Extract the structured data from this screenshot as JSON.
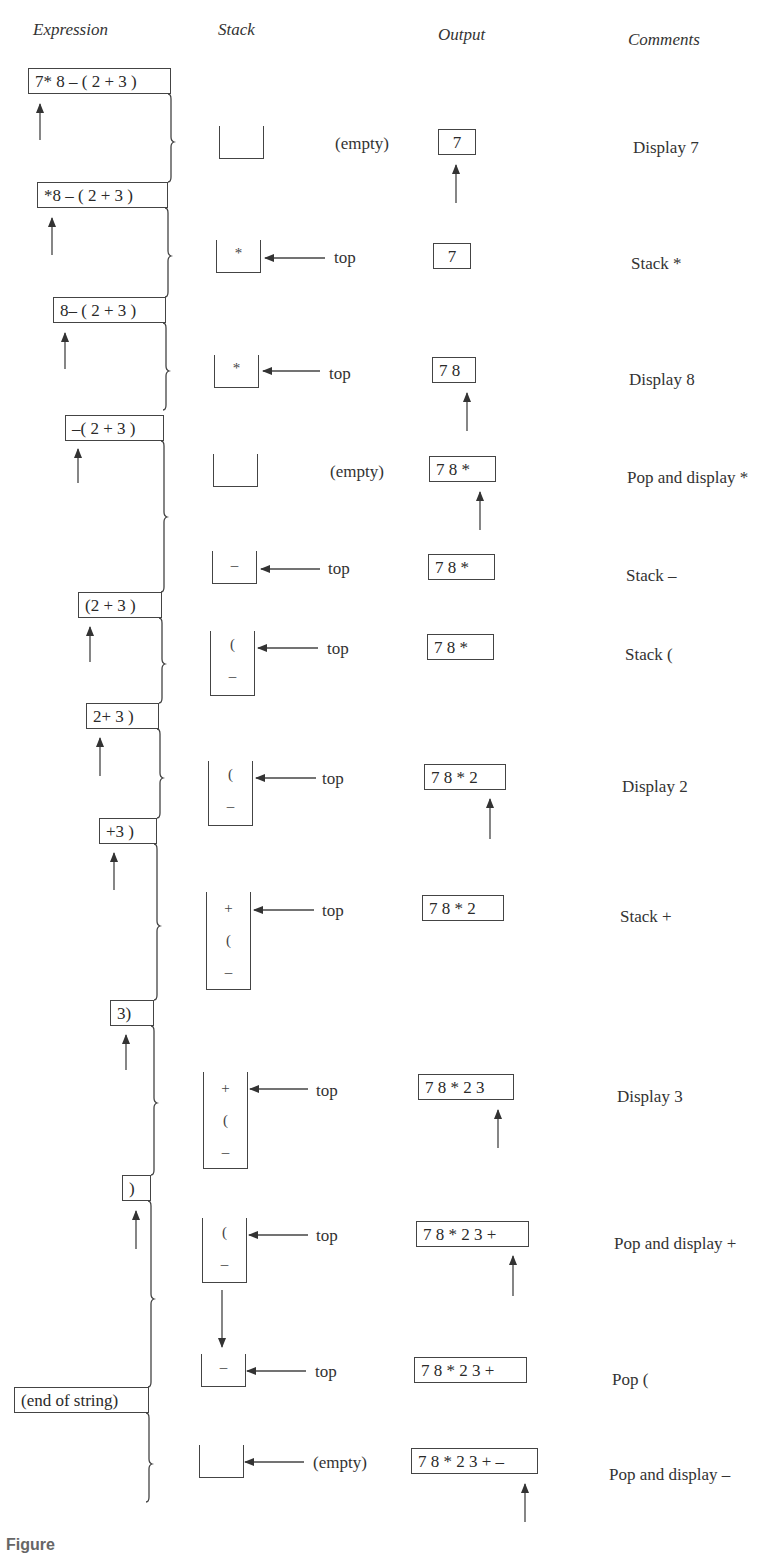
{
  "headers": {
    "expression": "Expression",
    "stack": "Stack",
    "output": "Output",
    "comments": "Comments"
  },
  "expressions": [
    "7* 8 – ( 2 + 3 )",
    "*8 – ( 2 + 3 )",
    "8– ( 2 + 3 )",
    "–( 2 + 3 )",
    "(2 + 3 )",
    "2+ 3 )",
    "+3 )",
    "3)",
    ")",
    "(end of string)"
  ],
  "steps": [
    {
      "stack": [],
      "stack_label": "(empty)",
      "output": "7",
      "comment": "Display 7"
    },
    {
      "stack": [
        "*"
      ],
      "stack_label": "top",
      "output": "7",
      "comment": "Stack *"
    },
    {
      "stack": [
        "*"
      ],
      "stack_label": "top",
      "output": "7 8",
      "comment": "Display 8"
    },
    {
      "stack": [],
      "stack_label": "(empty)",
      "output": "7 8  *",
      "comment": "Pop and display *"
    },
    {
      "stack": [
        "–"
      ],
      "stack_label": "top",
      "output": "7 8 *",
      "comment": "Stack –"
    },
    {
      "stack": [
        "(",
        "–"
      ],
      "stack_label": "top",
      "output": "7 8 *",
      "comment": "Stack ("
    },
    {
      "stack": [
        "(",
        "–"
      ],
      "stack_label": "top",
      "output": "7 8 *  2",
      "comment": "Display 2"
    },
    {
      "stack": [
        "+",
        "(",
        "–"
      ],
      "stack_label": "top",
      "output": "7 8 * 2",
      "comment": "Stack +"
    },
    {
      "stack": [
        "+",
        "(",
        "–"
      ],
      "stack_label": "top",
      "output": "7 8 * 2  3",
      "comment": "Display 3"
    },
    {
      "stack": [
        "(",
        "–"
      ],
      "stack_label": "top",
      "output": "7 8 * 2 3  +",
      "comment": "Pop and display +"
    },
    {
      "stack": [
        "–"
      ],
      "stack_label": "top",
      "output": "7 8 * 2 3 +",
      "comment": "Pop ("
    },
    {
      "stack": [],
      "stack_label": "(empty)",
      "output": "7 8 * 2 3 +  –",
      "comment": "Pop and display –"
    }
  ],
  "caption": "Figure"
}
